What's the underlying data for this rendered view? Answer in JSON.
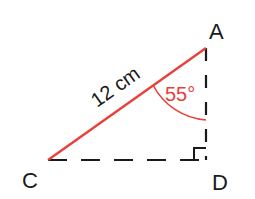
{
  "diagram": {
    "type": "right-triangle",
    "vertices": {
      "A": {
        "label": "A"
      },
      "C": {
        "label": "C"
      },
      "D": {
        "label": "D"
      }
    },
    "hypotenuse": {
      "from": "C",
      "to": "A",
      "label": "12 cm",
      "color": "#e8403a"
    },
    "angle": {
      "at": "A",
      "label": "55°",
      "color": "#e8403a"
    },
    "right_angle": {
      "at": "D"
    },
    "sides": {
      "CD": {
        "style": "dashed",
        "color": "#1a1a1a"
      },
      "AD": {
        "style": "dashed",
        "color": "#1a1a1a"
      }
    }
  }
}
